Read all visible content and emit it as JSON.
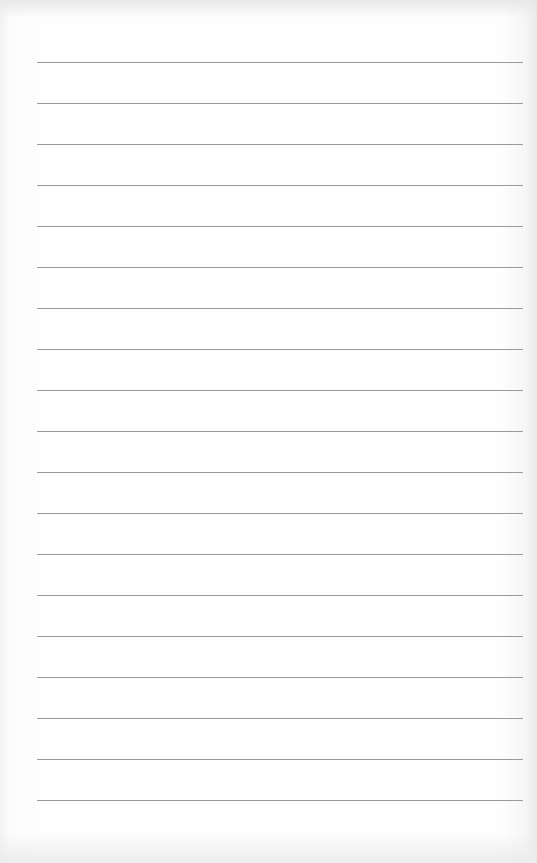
{
  "document": {
    "type": "lined-paper",
    "line_color": "#9a9a9a",
    "background_color": "#fdfdfd",
    "line_count": 19,
    "first_line_y": 62,
    "line_spacing": 41,
    "line_left": 37,
    "line_right": 523
  }
}
